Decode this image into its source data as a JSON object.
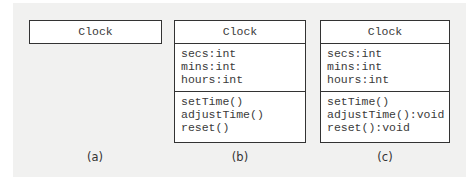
{
  "diagrams": [
    {
      "caption": "(a)",
      "class_name": "Clock",
      "attributes": [],
      "operations": []
    },
    {
      "caption": "(b)",
      "class_name": "Clock",
      "attributes": [
        "secs:int",
        "mins:int",
        "hours:int"
      ],
      "operations": [
        "setTime()",
        "adjustTime()",
        "reset()"
      ]
    },
    {
      "caption": "(c)",
      "class_name": "Clock",
      "attributes": [
        "secs:int",
        "mins:int",
        "hours:int"
      ],
      "operations": [
        "setTime()",
        "adjustTime():void",
        "reset():void"
      ]
    }
  ]
}
